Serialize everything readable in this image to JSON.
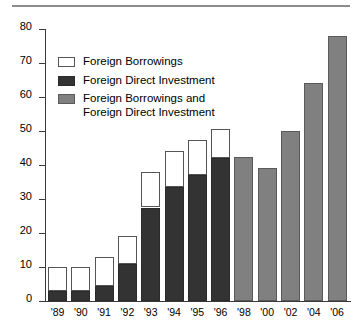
{
  "chart_data": {
    "type": "bar",
    "title": "",
    "subtitle": "",
    "xlabel": "",
    "ylabel": "",
    "ylim": [
      0,
      80
    ],
    "yticks": [
      0,
      10,
      20,
      30,
      40,
      50,
      60,
      70,
      80
    ],
    "ytick_labels": [
      "0",
      "10",
      "20",
      "30",
      "40",
      "50",
      "60",
      "70",
      "80"
    ],
    "grid": false,
    "stacked": true,
    "legend_position": "upper-left-inside",
    "categories": [
      "'89",
      "'90",
      "'91",
      "'92",
      "'93",
      "'94",
      "'95",
      "'96",
      "'98",
      "'00",
      "'02",
      "'04",
      "'06"
    ],
    "series": [
      {
        "name": "Foreign Direct Investment",
        "color": "#333333",
        "values": [
          3,
          3,
          4.5,
          11,
          27.5,
          33.5,
          37,
          42,
          null,
          null,
          null,
          null,
          null
        ]
      },
      {
        "name": "Foreign Borrowings",
        "color": "#ffffff",
        "values": [
          7,
          7,
          8.5,
          8,
          10.5,
          10.5,
          10.5,
          8.5,
          null,
          null,
          null,
          null,
          null
        ]
      },
      {
        "name": "Foreign Borrowings and Foreign Direct Investment",
        "color": "#808080",
        "values": [
          null,
          null,
          null,
          null,
          null,
          null,
          null,
          null,
          42.5,
          39,
          50,
          64,
          78
        ]
      }
    ],
    "totals": [
      10,
      10,
      13,
      19,
      38,
      44,
      47.5,
      50.5,
      42.5,
      39,
      50,
      64,
      78
    ]
  },
  "legend": {
    "items": [
      {
        "label": "Foreign Borrowings",
        "swatch": "white-swatch"
      },
      {
        "label": "Foreign Direct Investment",
        "swatch": "dark-swatch"
      },
      {
        "label": "Foreign Borrowings and\nForeign Direct Investment",
        "swatch": "gray-swatch"
      }
    ]
  }
}
